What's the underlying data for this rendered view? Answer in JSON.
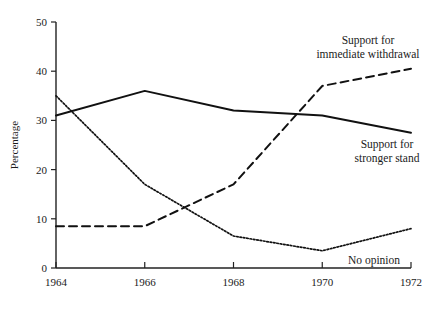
{
  "chart_data": {
    "type": "line",
    "title": "",
    "xlabel": "",
    "ylabel": "Percentage",
    "x": [
      1964,
      1966,
      1968,
      1970,
      1972
    ],
    "xtick_labels": [
      "1964",
      "1966",
      "1968",
      "1970",
      "1972"
    ],
    "ytick_labels": [
      "0",
      "10",
      "20",
      "30",
      "40",
      "50"
    ],
    "ytick_values": [
      0,
      10,
      20,
      30,
      40,
      50
    ],
    "xlim": [
      1964,
      1972
    ],
    "ylim": [
      0,
      50
    ],
    "grid": false,
    "legend_position": "inline-annotations",
    "series": [
      {
        "name": "Support for stronger stand",
        "style": "solid",
        "color": "#111111",
        "values": [
          31,
          36,
          32,
          31,
          27.5
        ]
      },
      {
        "name": "Support for immediate withdrawal",
        "style": "dashed",
        "color": "#111111",
        "values": [
          8.5,
          8.5,
          17,
          37,
          40.5
        ]
      },
      {
        "name": "No opinion",
        "style": "dotted",
        "color": "#111111",
        "values": [
          35,
          17,
          6.5,
          3.5,
          8
        ]
      }
    ],
    "annotations": [
      {
        "id": "immediate-withdrawal",
        "lines": [
          "Support for",
          "immediate withdrawal"
        ],
        "x_px": 368,
        "y_px": 44,
        "align": "center"
      },
      {
        "id": "stronger-stand",
        "lines": [
          "Support for",
          "stronger stand"
        ],
        "x_px": 387,
        "y_px": 148,
        "align": "center"
      },
      {
        "id": "no-opinion",
        "lines": [
          "No opinion"
        ],
        "x_px": 374,
        "y_px": 264,
        "align": "center"
      }
    ]
  }
}
